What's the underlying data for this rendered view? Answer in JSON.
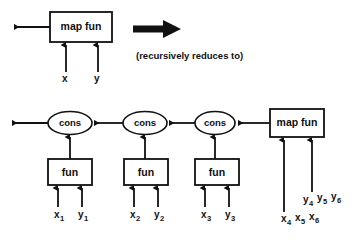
{
  "diagram": {
    "ink_color": "#111111",
    "background": "#ffffff",
    "caption": "(recursively reduces to)",
    "top": {
      "box_label": "map fun",
      "inputs": [
        {
          "label": "x"
        },
        {
          "label": "y"
        }
      ]
    },
    "reduce_arrow": {
      "name": "bold-right-arrow"
    },
    "bottom": {
      "cons_nodes": [
        {
          "label": "cons"
        },
        {
          "label": "cons"
        },
        {
          "label": "cons"
        }
      ],
      "fun_boxes": [
        {
          "label": "fun"
        },
        {
          "label": "fun"
        },
        {
          "label": "fun"
        }
      ],
      "fun_inputs": [
        {
          "x": "x",
          "x_sub": "1",
          "y": "y",
          "y_sub": "1"
        },
        {
          "x": "x",
          "x_sub": "2",
          "y": "y",
          "y_sub": "2"
        },
        {
          "x": "x",
          "x_sub": "3",
          "y": "y",
          "y_sub": "3"
        }
      ],
      "map_box_label": "map fun",
      "map_inputs": {
        "x_row": [
          {
            "base": "x",
            "sub": "4"
          },
          {
            "base": "x",
            "sub": "5"
          },
          {
            "base": "x",
            "sub": "6"
          }
        ],
        "y_row": [
          {
            "base": "y",
            "sub": "4"
          },
          {
            "base": "y",
            "sub": "5"
          },
          {
            "base": "y",
            "sub": "6"
          }
        ]
      }
    }
  }
}
